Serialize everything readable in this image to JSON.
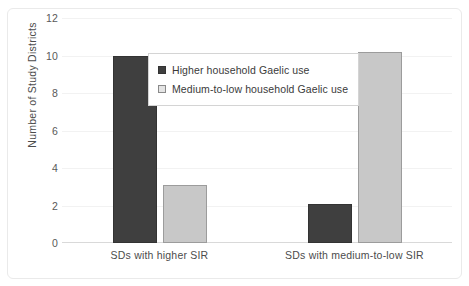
{
  "chart_data": {
    "type": "bar",
    "title": "",
    "xlabel": "",
    "ylabel": "Number of Study Districts",
    "categories": [
      "SDs with higher SIR",
      "SDs with medium-to-low SIR"
    ],
    "series": [
      {
        "name": "Higher household Gaelic use",
        "color": "#3f3f3f",
        "values": [
          10,
          2.1
        ]
      },
      {
        "name": "Medium-to-low household Gaelic use",
        "color": "#c8c8c8",
        "values": [
          3.1,
          10.2
        ]
      }
    ],
    "ylim": [
      0,
      12
    ],
    "yticks": [
      0,
      2,
      4,
      6,
      8,
      10,
      12
    ],
    "ytick_labels": [
      "0",
      "2",
      "4",
      "6",
      "8",
      "10",
      "12"
    ],
    "grid": true,
    "legend_position": "inside-upper-center"
  },
  "legend": {
    "entries": [
      {
        "label": "Higher household Gaelic use",
        "swatch": "dark-square-icon"
      },
      {
        "label": "Medium-to-low household Gaelic use",
        "swatch": "light-square-icon"
      }
    ]
  },
  "colors": {
    "dark_series": "#3f3f3f",
    "light_series": "#c8c8c8",
    "gridline": "#f2f2f2",
    "axis": "#d9d9d9",
    "text": "#4c4c4c",
    "figure_border": "#eaeaea"
  }
}
